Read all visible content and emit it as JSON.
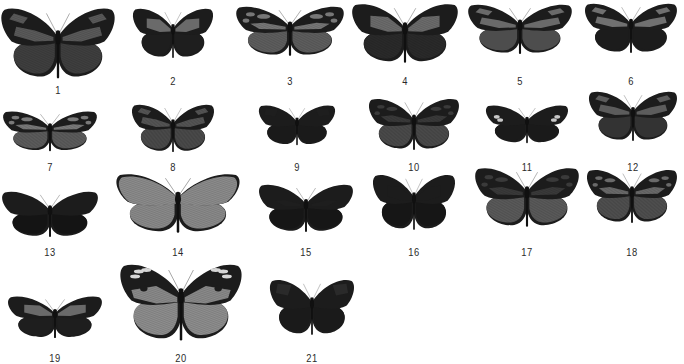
{
  "figure": {
    "type": "specimen-plate",
    "colors": {
      "background": "#ffffff",
      "wing_dark": "#1c1c1c",
      "wing_mid": "#555555",
      "wing_light": "#8a8a8a",
      "label": "#2a2a2a"
    },
    "specimens": [
      {
        "label": "1",
        "cx": 58,
        "top": 6,
        "w": 116,
        "h": 74,
        "label_y": 84,
        "fw": "#5a5a5a",
        "hw": "#3f3f3f",
        "pattern": "banded",
        "veins": true
      },
      {
        "label": "2",
        "cx": 173,
        "top": 7,
        "w": 82,
        "h": 52,
        "label_y": 75,
        "fw": "#6a6a6a",
        "hw": "#1e1e1e",
        "pattern": "basal-patch",
        "veins": false
      },
      {
        "label": "3",
        "cx": 290,
        "top": 5,
        "w": 110,
        "h": 52,
        "label_y": 75,
        "fw": "#777777",
        "hw": "#5e5e5e",
        "pattern": "spotted",
        "veins": true
      },
      {
        "label": "4",
        "cx": 405,
        "top": 2,
        "w": 108,
        "h": 62,
        "label_y": 75,
        "fw": "#6c6c6c",
        "hw": "#2a2a2a",
        "pattern": "basal-patch",
        "veins": true
      },
      {
        "label": "5",
        "cx": 520,
        "top": 3,
        "w": 106,
        "h": 52,
        "label_y": 75,
        "fw": "#6a6a6a",
        "hw": "#4d4d4d",
        "pattern": "banded",
        "veins": false
      },
      {
        "label": "6",
        "cx": 631,
        "top": 2,
        "w": 94,
        "h": 52,
        "label_y": 75,
        "fw": "#707070",
        "hw": "#1c1c1c",
        "pattern": "banded",
        "veins": false
      },
      {
        "label": "7",
        "cx": 50,
        "top": 110,
        "w": 96,
        "h": 42,
        "label_y": 161,
        "fw": "#7a7a7a",
        "hw": "#5c5c5c",
        "pattern": "spotted",
        "veins": true
      },
      {
        "label": "8",
        "cx": 173,
        "top": 103,
        "w": 84,
        "h": 50,
        "label_y": 161,
        "fw": "#555555",
        "hw": "#4a4a4a",
        "pattern": "banded",
        "veins": true
      },
      {
        "label": "9",
        "cx": 297,
        "top": 104,
        "w": 78,
        "h": 42,
        "label_y": 161,
        "fw": "#1e1e1e",
        "hw": "#1a1a1a",
        "pattern": "apical-band",
        "veins": false
      },
      {
        "label": "10",
        "cx": 414,
        "top": 97,
        "w": 92,
        "h": 54,
        "label_y": 161,
        "fw": "#3a3a3a",
        "hw": "#4a4a4a",
        "pattern": "spotted",
        "veins": true
      },
      {
        "label": "11",
        "cx": 527,
        "top": 104,
        "w": 84,
        "h": 40,
        "label_y": 161,
        "fw": "#1c1c1c",
        "hw": "#1a1a1a",
        "pattern": "white-spots",
        "veins": false
      },
      {
        "label": "12",
        "cx": 633,
        "top": 90,
        "w": 90,
        "h": 52,
        "label_y": 161,
        "fw": "#5c5c5c",
        "hw": "#333333",
        "pattern": "banded",
        "veins": false
      },
      {
        "label": "13",
        "cx": 50,
        "top": 190,
        "w": 98,
        "h": 48,
        "label_y": 246,
        "fw": "#141414",
        "hw": "#141414",
        "pattern": "solid",
        "veins": false
      },
      {
        "label": "14",
        "cx": 178,
        "top": 172,
        "w": 126,
        "h": 62,
        "label_y": 246,
        "fw": "#8c8c8c",
        "hw": "#8a8a8a",
        "pattern": "translucent",
        "veins": true
      },
      {
        "label": "15",
        "cx": 306,
        "top": 183,
        "w": 96,
        "h": 50,
        "label_y": 246,
        "fw": "#1e1e1e",
        "hw": "#161616",
        "pattern": "faint-band",
        "veins": false
      },
      {
        "label": "16",
        "cx": 414,
        "top": 173,
        "w": 84,
        "h": 58,
        "label_y": 246,
        "fw": "#1c1c1c",
        "hw": "#161616",
        "pattern": "basal-patch",
        "veins": false
      },
      {
        "label": "17",
        "cx": 527,
        "top": 166,
        "w": 106,
        "h": 62,
        "label_y": 246,
        "fw": "#3a3a3a",
        "hw": "#5a5a5a",
        "pattern": "spotted",
        "veins": true
      },
      {
        "label": "18",
        "cx": 632,
        "top": 168,
        "w": 92,
        "h": 56,
        "label_y": 246,
        "fw": "#6a6a6a",
        "hw": "#4f4f4f",
        "pattern": "spotted",
        "veins": true
      },
      {
        "label": "19",
        "cx": 55,
        "top": 295,
        "w": 96,
        "h": 44,
        "label_y": 352,
        "fw": "#6a6a6a",
        "hw": "#1e1e1e",
        "pattern": "basal-patch",
        "veins": false
      },
      {
        "label": "20",
        "cx": 181,
        "top": 262,
        "w": 124,
        "h": 80,
        "label_y": 352,
        "fw": "#8a8a8a",
        "hw": "#8e8e8e",
        "pattern": "white-spots-apex",
        "veins": true
      },
      {
        "label": "21",
        "cx": 312,
        "top": 278,
        "w": 86,
        "h": 58,
        "label_y": 352,
        "fw": "#2a2a2a",
        "hw": "#1a1a1a",
        "pattern": "apical-band",
        "veins": false
      }
    ]
  }
}
